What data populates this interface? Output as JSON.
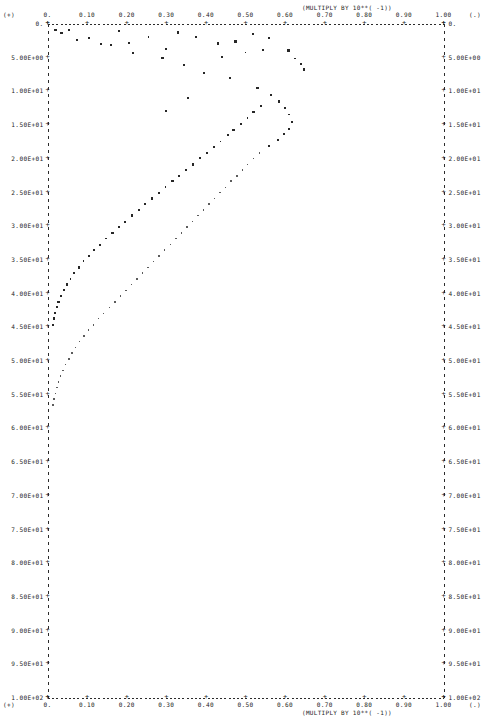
{
  "chart_data": {
    "type": "scatter",
    "title": "",
    "subtitle": "",
    "xlabel": "(MULTIPLY BY 10**( -1))",
    "ylabel": "",
    "top_axis_note": "(MULTIPLY BY 10**( -1))",
    "bottom_axis_note": "(MULTIPLY BY 10**( -1))",
    "grid": false,
    "legend": "none",
    "xlim": [
      0.0,
      1.0
    ],
    "ylim": [
      0.0,
      100.0
    ],
    "y_axis_inverted": true,
    "x_ticks": [
      "0.",
      "0.10",
      "0.20",
      "0.30",
      "0.40",
      "0.50",
      "0.60",
      "0.70",
      "0.80",
      "0.90",
      "1.00"
    ],
    "x_tick_values": [
      0.0,
      0.1,
      0.2,
      0.3,
      0.4,
      0.5,
      0.6,
      0.7,
      0.8,
      0.9,
      1.0
    ],
    "y_ticks": [
      "0.",
      "5.00E+00",
      "1.00E+01",
      "1.50E+01",
      "2.00E+01",
      "2.50E+01",
      "3.00E+01",
      "3.50E+01",
      "4.00E+01",
      "4.50E+01",
      "5.00E+01",
      "5.50E+01",
      "6.00E+01",
      "6.50E+01",
      "7.00E+01",
      "7.50E+01",
      "8.00E+01",
      "8.50E+01",
      "9.00E+01",
      "9.50E+01",
      "1.00E+02"
    ],
    "y_tick_values": [
      0,
      5,
      10,
      15,
      20,
      25,
      30,
      35,
      40,
      45,
      50,
      55,
      60,
      65,
      70,
      75,
      80,
      85,
      90,
      95,
      100
    ],
    "corner_marks": {
      "top_left": "(+)",
      "top_right": "(.)",
      "bottom_left": "(+)",
      "bottom_right": "(.)"
    },
    "series": [
      {
        "name": "branch-a",
        "marker": "square",
        "points": [
          [
            0.035,
            1.4
          ],
          [
            0.105,
            2.2
          ],
          [
            0.055,
            1.0
          ],
          [
            0.16,
            3.2
          ],
          [
            0.215,
            4.4
          ],
          [
            0.255,
            2.0
          ],
          [
            0.29,
            5.1
          ],
          [
            0.345,
            6.2
          ],
          [
            0.395,
            7.3
          ],
          [
            0.43,
            3.0
          ],
          [
            0.46,
            8.1
          ],
          [
            0.5,
            4.3
          ],
          [
            0.53,
            9.6
          ],
          [
            0.545,
            3.9
          ],
          [
            0.565,
            10.6
          ],
          [
            0.585,
            11.6
          ],
          [
            0.6,
            12.5
          ],
          [
            0.61,
            13.5
          ],
          [
            0.618,
            14.6
          ],
          [
            0.61,
            15.6
          ],
          [
            0.598,
            16.4
          ],
          [
            0.582,
            17.3
          ],
          [
            0.56,
            18.2
          ],
          [
            0.54,
            12.2
          ],
          [
            0.52,
            13.1
          ],
          [
            0.505,
            14.0
          ],
          [
            0.488,
            14.9
          ],
          [
            0.47,
            15.8
          ],
          [
            0.455,
            16.6
          ],
          [
            0.437,
            17.5
          ],
          [
            0.42,
            18.3
          ],
          [
            0.402,
            19.2
          ],
          [
            0.385,
            20.0
          ],
          [
            0.368,
            20.9
          ],
          [
            0.35,
            21.7
          ],
          [
            0.333,
            22.6
          ],
          [
            0.316,
            23.4
          ],
          [
            0.298,
            24.3
          ],
          [
            0.281,
            25.1
          ],
          [
            0.264,
            26.0
          ],
          [
            0.247,
            26.8
          ],
          [
            0.23,
            27.7
          ],
          [
            0.213,
            28.5
          ],
          [
            0.196,
            29.4
          ],
          [
            0.18,
            30.2
          ],
          [
            0.164,
            31.1
          ],
          [
            0.148,
            31.9
          ],
          [
            0.133,
            32.8
          ],
          [
            0.118,
            33.6
          ],
          [
            0.104,
            34.5
          ],
          [
            0.091,
            35.3
          ],
          [
            0.079,
            36.2
          ],
          [
            0.068,
            37.0
          ],
          [
            0.058,
            37.9
          ],
          [
            0.049,
            38.7
          ],
          [
            0.041,
            39.6
          ],
          [
            0.034,
            40.4
          ],
          [
            0.028,
            41.3
          ],
          [
            0.023,
            42.1
          ],
          [
            0.019,
            43.0
          ],
          [
            0.016,
            43.8
          ],
          [
            0.013,
            44.7
          ]
        ]
      },
      {
        "name": "branch-b",
        "marker": "dot",
        "points": [
          [
            0.535,
            19.2
          ],
          [
            0.52,
            20.0
          ],
          [
            0.505,
            20.9
          ],
          [
            0.492,
            21.7
          ],
          [
            0.478,
            22.6
          ],
          [
            0.464,
            23.4
          ],
          [
            0.45,
            24.3
          ],
          [
            0.436,
            25.1
          ],
          [
            0.422,
            26.0
          ],
          [
            0.408,
            26.8
          ],
          [
            0.394,
            27.7
          ],
          [
            0.38,
            28.5
          ],
          [
            0.366,
            29.4
          ],
          [
            0.352,
            30.2
          ],
          [
            0.338,
            31.1
          ],
          [
            0.324,
            31.9
          ],
          [
            0.31,
            32.8
          ],
          [
            0.296,
            33.6
          ],
          [
            0.282,
            34.5
          ],
          [
            0.268,
            35.3
          ],
          [
            0.254,
            36.2
          ],
          [
            0.24,
            37.0
          ],
          [
            0.226,
            37.9
          ],
          [
            0.212,
            38.7
          ],
          [
            0.198,
            39.6
          ],
          [
            0.184,
            40.4
          ],
          [
            0.17,
            41.3
          ],
          [
            0.156,
            42.1
          ],
          [
            0.142,
            43.0
          ],
          [
            0.129,
            43.8
          ],
          [
            0.116,
            44.7
          ],
          [
            0.104,
            45.5
          ],
          [
            0.092,
            46.4
          ],
          [
            0.081,
            47.2
          ],
          [
            0.071,
            48.1
          ],
          [
            0.062,
            48.9
          ],
          [
            0.054,
            49.8
          ],
          [
            0.046,
            50.6
          ],
          [
            0.039,
            51.5
          ],
          [
            0.033,
            52.3
          ],
          [
            0.028,
            53.2
          ],
          [
            0.024,
            54.0
          ],
          [
            0.02,
            54.9
          ],
          [
            0.017,
            55.7
          ],
          [
            0.014,
            56.6
          ]
        ]
      },
      {
        "name": "scatter-upper",
        "marker": "square",
        "points": [
          [
            0.02,
            1.0
          ],
          [
            0.075,
            2.4
          ],
          [
            0.135,
            3.1
          ],
          [
            0.18,
            1.1
          ],
          [
            0.205,
            2.9
          ],
          [
            0.3,
            3.8
          ],
          [
            0.33,
            1.3
          ],
          [
            0.375,
            2.0
          ],
          [
            0.44,
            5.0
          ],
          [
            0.475,
            2.7
          ],
          [
            0.52,
            1.6
          ],
          [
            0.56,
            2.2
          ],
          [
            0.608,
            4.0
          ],
          [
            0.625,
            5.2
          ],
          [
            0.64,
            6.0
          ],
          [
            0.648,
            6.8
          ],
          [
            0.3,
            13.0
          ],
          [
            0.355,
            11.0
          ]
        ]
      }
    ]
  },
  "axes": {
    "top_note": "(MULTIPLY BY 10**( -1))",
    "bottom_note": "(MULTIPLY BY 10**( -1))",
    "top_left_corner": "(+)",
    "top_right_corner": "(.)",
    "bottom_left_corner": "(+)",
    "bottom_right_corner": "(.)",
    "origin_label_left": "0.",
    "origin_label_right": "0.",
    "end_label_left": "1.00E+02",
    "end_label_right": "1.00E+02"
  }
}
